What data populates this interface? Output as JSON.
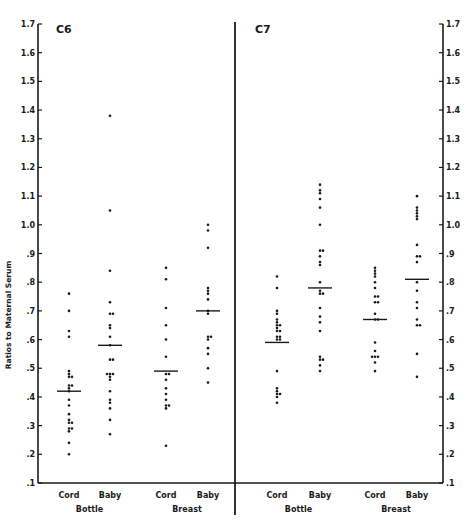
{
  "chart_data": {
    "type": "scatter",
    "ylabel": "Ratios to Maternal Serum",
    "ylim": [
      0.1,
      1.7
    ],
    "y_ticks": [
      "1.7",
      "1.6",
      "1.5",
      "1.4",
      "1.3",
      "1.2",
      "1.1",
      "1.0",
      ".9",
      ".8",
      ".7",
      ".6",
      ".5",
      ".4",
      ".3",
      ".2",
      ".1"
    ],
    "grid": false,
    "panels": [
      {
        "title": "C6",
        "groups": [
          {
            "feeding": "Bottle",
            "categories": [
              {
                "label": "Cord",
                "median": 0.42,
                "values": [
                  0.76,
                  0.7,
                  0.63,
                  0.61,
                  0.49,
                  0.48,
                  0.47,
                  0.47,
                  0.44,
                  0.44,
                  0.43,
                  0.42,
                  0.39,
                  0.37,
                  0.34,
                  0.32,
                  0.31,
                  0.31,
                  0.29,
                  0.29,
                  0.28,
                  0.24,
                  0.2
                ]
              },
              {
                "label": "Baby",
                "median": 0.58,
                "values": [
                  1.38,
                  1.05,
                  0.84,
                  0.73,
                  0.69,
                  0.69,
                  0.65,
                  0.64,
                  0.61,
                  0.58,
                  0.53,
                  0.53,
                  0.48,
                  0.48,
                  0.48,
                  0.47,
                  0.46,
                  0.42,
                  0.39,
                  0.38,
                  0.36,
                  0.32,
                  0.27
                ]
              }
            ]
          },
          {
            "feeding": "Breast",
            "categories": [
              {
                "label": "Cord",
                "median": 0.49,
                "values": [
                  0.85,
                  0.81,
                  0.71,
                  0.65,
                  0.6,
                  0.54,
                  0.48,
                  0.48,
                  0.46,
                  0.43,
                  0.41,
                  0.39,
                  0.37,
                  0.37,
                  0.36,
                  0.23
                ]
              },
              {
                "label": "Baby",
                "median": 0.7,
                "values": [
                  1.0,
                  0.98,
                  0.92,
                  0.78,
                  0.77,
                  0.76,
                  0.74,
                  0.7,
                  0.69,
                  0.61,
                  0.61,
                  0.6,
                  0.57,
                  0.55,
                  0.5,
                  0.45
                ]
              }
            ]
          }
        ]
      },
      {
        "title": "C7",
        "groups": [
          {
            "feeding": "Bottle",
            "categories": [
              {
                "label": "Cord",
                "median": 0.59,
                "values": [
                  0.82,
                  0.78,
                  0.7,
                  0.69,
                  0.67,
                  0.66,
                  0.65,
                  0.65,
                  0.64,
                  0.63,
                  0.63,
                  0.61,
                  0.61,
                  0.6,
                  0.6,
                  0.49,
                  0.43,
                  0.42,
                  0.41,
                  0.41,
                  0.4,
                  0.38
                ]
              },
              {
                "label": "Baby",
                "median": 0.78,
                "values": [
                  1.14,
                  1.12,
                  1.11,
                  1.09,
                  1.06,
                  1.0,
                  0.91,
                  0.91,
                  0.89,
                  0.87,
                  0.86,
                  0.8,
                  0.77,
                  0.76,
                  0.76,
                  0.71,
                  0.68,
                  0.66,
                  0.63,
                  0.54,
                  0.53,
                  0.53,
                  0.51,
                  0.49
                ]
              }
            ]
          },
          {
            "feeding": "Breast",
            "categories": [
              {
                "label": "Cord",
                "median": 0.67,
                "values": [
                  0.85,
                  0.84,
                  0.83,
                  0.82,
                  0.8,
                  0.78,
                  0.75,
                  0.75,
                  0.73,
                  0.73,
                  0.69,
                  0.67,
                  0.67,
                  0.59,
                  0.56,
                  0.54,
                  0.54,
                  0.54,
                  0.52,
                  0.49
                ]
              },
              {
                "label": "Baby",
                "median": 0.81,
                "values": [
                  1.1,
                  1.06,
                  1.05,
                  1.04,
                  1.03,
                  1.02,
                  0.93,
                  0.89,
                  0.89,
                  0.87,
                  0.8,
                  0.77,
                  0.73,
                  0.71,
                  0.67,
                  0.65,
                  0.65,
                  0.55,
                  0.47
                ]
              }
            ]
          }
        ]
      }
    ]
  },
  "labels": {
    "ylabel": "Ratios to Maternal Serum",
    "c6_title": "C6",
    "c7_title": "C7",
    "cord": "Cord",
    "baby": "Baby",
    "bottle": "Bottle",
    "breast": "Breast"
  },
  "colors": {
    "ink": "#1a1a1a",
    "background": "#ffffff"
  }
}
